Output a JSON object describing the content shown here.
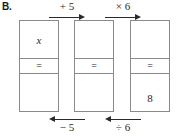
{
  "problem": {
    "label": "B."
  },
  "boxes": [
    {
      "name": "first-equation-box",
      "top_cell": "x",
      "middle_cell": "=",
      "bottom_cell": ""
    },
    {
      "name": "second-equation-box",
      "top_cell": "",
      "middle_cell": "=",
      "bottom_cell": ""
    },
    {
      "name": "third-equation-box",
      "top_cell": "",
      "middle_cell": "=",
      "bottom_cell": "8"
    }
  ],
  "arrows": {
    "top": [
      {
        "label": "+ 5",
        "direction": "right",
        "icon": "arrow-right-icon"
      },
      {
        "label": "× 6",
        "direction": "right",
        "icon": "arrow-right-icon"
      }
    ],
    "bottom": [
      {
        "label": "− 5",
        "direction": "left",
        "icon": "arrow-left-icon"
      },
      {
        "label": "÷ 6",
        "direction": "left",
        "icon": "arrow-left-icon"
      }
    ]
  },
  "colors": {
    "box_border": "#8a8a8a",
    "ink": "#2a2a2a",
    "background": "#ffffff"
  }
}
